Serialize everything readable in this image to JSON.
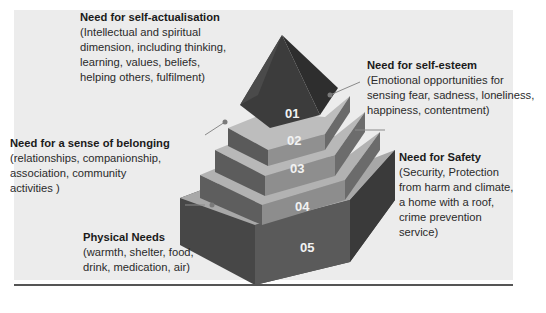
{
  "figure": {
    "type": "pyramid-diagram",
    "tiers": [
      {
        "number": "01",
        "title": "Need for self-actualisation",
        "description": [
          "(Intellectual and spiritual",
          "dimension, including thinking,",
          "learning, values, beliefs,",
          "helping others, fulfilment)"
        ]
      },
      {
        "number": "02",
        "title": "Need for self-esteem",
        "description": [
          "(Emotional opportunities for",
          "sensing fear, sadness, loneliness,",
          "happiness, contentment)"
        ]
      },
      {
        "number": "03",
        "title": "Need for a sense of belonging",
        "description": [
          "(relationships, companionship,",
          "association, community",
          "activities )"
        ]
      },
      {
        "number": "04",
        "title": "Need for Safety",
        "description": [
          "(Security, Protection",
          "from harm and climate,",
          "a home with a roof,",
          "crime prevention",
          "service)"
        ]
      },
      {
        "number": "05",
        "title": "Physical Needs",
        "description": [
          "(warmth, shelter, food,",
          "drink, medication, air)"
        ]
      }
    ]
  },
  "colors": {
    "panel_bg": "#ececec",
    "tier_top": "#b5b5b5",
    "tier_front": "#8a8a8a",
    "tier_side": "#6e6e6e",
    "apex_dark": "#3c3c3c",
    "base_dark": "#474747"
  }
}
